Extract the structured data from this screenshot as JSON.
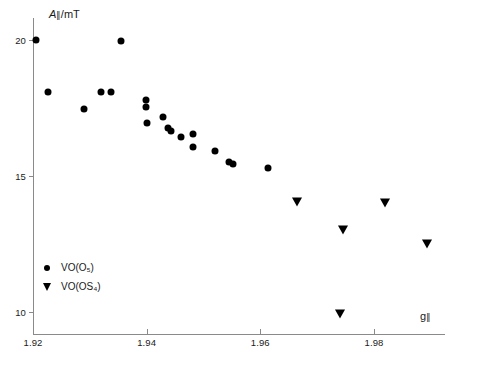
{
  "chart_data": {
    "type": "scatter",
    "title": "",
    "xlabel": "g∥",
    "ylabel": "A∥/mT",
    "xlim": [
      1.92,
      1.9925
    ],
    "ylim": [
      9.2,
      20.8
    ],
    "grid": false,
    "legend_position": "lower-left-inside",
    "xticks": [
      "1.92",
      "1.94",
      "1.96",
      "1.98"
    ],
    "xtick_values": [
      1.92,
      1.94,
      1.96,
      1.98
    ],
    "yticks": [
      "20",
      "15",
      "10"
    ],
    "ytick_values": [
      20,
      15,
      10
    ],
    "series": [
      {
        "name": "VO(O₅)",
        "marker": "circle",
        "color": "#000000",
        "points": [
          {
            "x": 1.9205,
            "y": 20.0
          },
          {
            "x": 1.9227,
            "y": 18.1
          },
          {
            "x": 1.9289,
            "y": 17.45
          },
          {
            "x": 1.9319,
            "y": 18.1
          },
          {
            "x": 1.9338,
            "y": 18.1
          },
          {
            "x": 1.9355,
            "y": 19.95
          },
          {
            "x": 1.9399,
            "y": 17.8
          },
          {
            "x": 1.9399,
            "y": 17.55
          },
          {
            "x": 1.94,
            "y": 16.95
          },
          {
            "x": 1.9428,
            "y": 17.15
          },
          {
            "x": 1.9437,
            "y": 16.75
          },
          {
            "x": 1.9443,
            "y": 16.65
          },
          {
            "x": 1.946,
            "y": 16.45
          },
          {
            "x": 1.9481,
            "y": 16.05
          },
          {
            "x": 1.9481,
            "y": 16.55
          },
          {
            "x": 1.952,
            "y": 15.9
          },
          {
            "x": 1.9545,
            "y": 15.5
          },
          {
            "x": 1.9552,
            "y": 15.45
          },
          {
            "x": 1.9614,
            "y": 15.3
          }
        ]
      },
      {
        "name": "VO(OS₄)",
        "marker": "triangle-down",
        "color": "#000000",
        "points": [
          {
            "x": 1.9665,
            "y": 14.05
          },
          {
            "x": 1.9746,
            "y": 13.0
          },
          {
            "x": 1.9741,
            "y": 9.95
          },
          {
            "x": 1.9819,
            "y": 14.0
          },
          {
            "x": 1.9893,
            "y": 12.5
          }
        ]
      }
    ]
  }
}
